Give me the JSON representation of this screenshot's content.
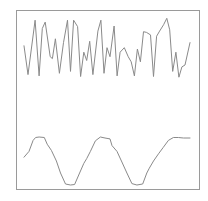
{
  "chart_data": [
    {
      "type": "line",
      "title": "",
      "xlabel": "",
      "ylabel": "",
      "grid": false,
      "legend": "none",
      "ylim": [
        0,
        1
      ],
      "xlim": [
        0,
        1
      ],
      "series": [
        {
          "name": "noisy-signal",
          "color": "#8a8a8a",
          "x": [
            0.0,
            0.024,
            0.067,
            0.091,
            0.11,
            0.128,
            0.158,
            0.171,
            0.189,
            0.213,
            0.238,
            0.262,
            0.28,
            0.299,
            0.323,
            0.341,
            0.36,
            0.378,
            0.396,
            0.415,
            0.445,
            0.463,
            0.482,
            0.5,
            0.518,
            0.543,
            0.561,
            0.579,
            0.604,
            0.628,
            0.646,
            0.665,
            0.683,
            0.701,
            0.72,
            0.738,
            0.762,
            0.78,
            0.799,
            0.817,
            0.841,
            0.86,
            0.878,
            0.896,
            0.915,
            0.933,
            0.951,
            0.97,
            1.0
          ],
          "y": [
            0.55,
            0.1,
            0.95,
            0.08,
            0.82,
            0.92,
            0.38,
            0.35,
            0.66,
            0.12,
            0.6,
            0.95,
            0.15,
            0.95,
            0.85,
            0.07,
            0.45,
            0.32,
            0.62,
            0.1,
            0.78,
            0.95,
            0.12,
            0.52,
            0.38,
            0.86,
            0.08,
            0.45,
            0.52,
            0.38,
            0.3,
            0.08,
            0.5,
            0.3,
            0.77,
            0.76,
            0.72,
            0.07,
            0.7,
            0.78,
            0.88,
            0.98,
            0.8,
            0.15,
            0.45,
            0.06,
            0.22,
            0.25,
            0.6
          ]
        },
        {
          "name": "periodic-signal",
          "color": "#8a8a8a",
          "x": [
            0.0,
            0.03,
            0.055,
            0.07,
            0.091,
            0.122,
            0.14,
            0.165,
            0.195,
            0.22,
            0.25,
            0.28,
            0.305,
            0.335,
            0.36,
            0.378,
            0.4,
            0.43,
            0.46,
            0.488,
            0.518,
            0.53,
            0.56,
            0.59,
            0.62,
            0.65,
            0.68,
            0.715,
            0.74,
            0.755,
            0.78,
            0.81,
            0.838,
            0.87,
            0.9,
            0.93,
            0.96,
            1.0
          ],
          "y": [
            0.58,
            0.7,
            0.93,
            0.99,
            1.0,
            0.99,
            0.85,
            0.72,
            0.5,
            0.25,
            0.02,
            0.0,
            0.01,
            0.25,
            0.45,
            0.55,
            0.7,
            0.92,
            1.0,
            0.98,
            0.96,
            0.82,
            0.7,
            0.48,
            0.25,
            0.03,
            0.0,
            0.02,
            0.25,
            0.35,
            0.5,
            0.65,
            0.78,
            0.93,
            0.99,
            0.99,
            0.98,
            0.98
          ]
        }
      ]
    }
  ]
}
